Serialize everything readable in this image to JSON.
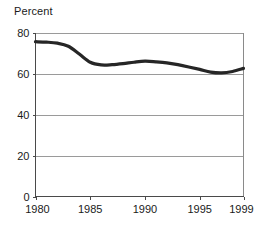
{
  "chart_data": {
    "type": "line",
    "title": "Percent",
    "xlabel": "",
    "ylabel": "",
    "xlim": [
      1980,
      1999
    ],
    "ylim": [
      0,
      80
    ],
    "grid": true,
    "legend": "none",
    "y_ticks": [
      0,
      20,
      40,
      60,
      80
    ],
    "y_tick_labels": [
      "0",
      "20",
      "40",
      "60",
      "80"
    ],
    "x_ticks": [
      1980,
      1985,
      1990,
      1995,
      1999
    ],
    "x_tick_labels": [
      "1980",
      "1985",
      "1990",
      "1995",
      "1999"
    ],
    "series": [
      {
        "name": "Percent",
        "color": "#262626",
        "x": [
          1980,
          1981,
          1982,
          1983,
          1984,
          1985,
          1986,
          1987,
          1988,
          1989,
          1990,
          1991,
          1992,
          1993,
          1994,
          1995,
          1996,
          1997,
          1998,
          1999
        ],
        "values": [
          75.5,
          75.3,
          74.8,
          73.3,
          69.5,
          65.5,
          64.2,
          64.3,
          64.8,
          65.5,
          66.0,
          65.7,
          65.2,
          64.3,
          63.2,
          62.0,
          60.7,
          60.3,
          61.0,
          62.5
        ]
      }
    ]
  },
  "title_text": "Percent"
}
